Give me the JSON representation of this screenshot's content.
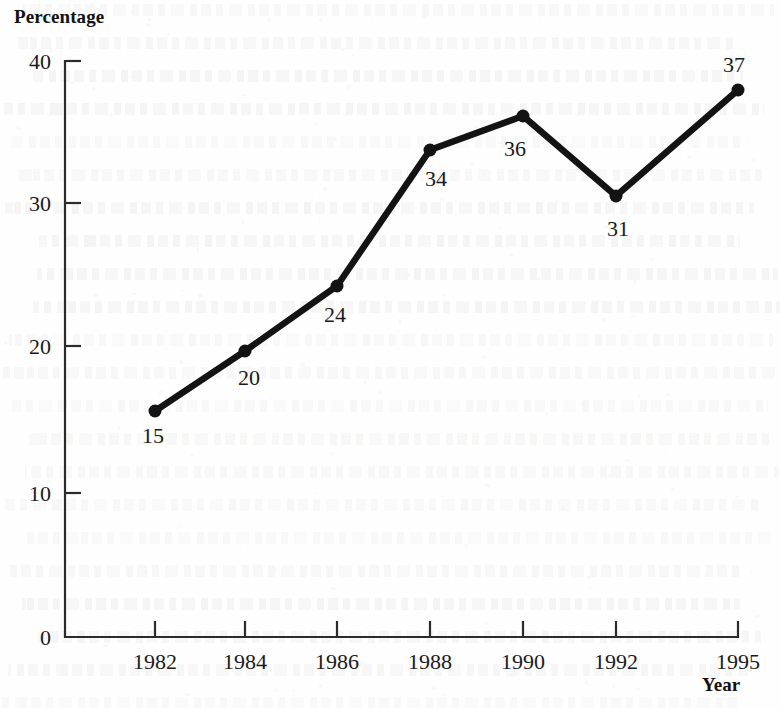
{
  "chart_data": {
    "type": "line",
    "title": "",
    "xlabel": "Year",
    "ylabel": "Percentage",
    "categories": [
      "1982",
      "1984",
      "1986",
      "1988",
      "1990",
      "1992",
      "1995"
    ],
    "values": [
      15,
      20,
      24,
      34,
      36,
      31,
      37
    ],
    "plotted_values": [
      15.5,
      19.9,
      24.4,
      33.8,
      36.2,
      30.6,
      38.0
    ],
    "point_labels": [
      "15",
      "20",
      "24",
      "34",
      "36",
      "31",
      "37"
    ],
    "series": [
      {
        "name": "Percentage",
        "values": [
          15,
          20,
          24,
          34,
          36,
          31,
          37
        ]
      }
    ],
    "ylim": [
      0,
      40
    ],
    "y_ticks": [
      "0",
      "10",
      "20",
      "30",
      "40"
    ],
    "y_tick_values": [
      0,
      10,
      20,
      30,
      40
    ],
    "x_ticks": [
      "1982",
      "1984",
      "1986",
      "1988",
      "1990",
      "1992",
      "1995"
    ],
    "grid": false,
    "legend": "none",
    "marker": "filled-circle",
    "line_color": "#131313",
    "axis_color": "#2b2b2b",
    "background_color": "#fefefe"
  },
  "axes": {
    "y_title": "Percentage",
    "x_title": "Year"
  },
  "geometry": {
    "plot_left": 65,
    "plot_bottom": 637,
    "plot_top": 61,
    "plot_right": 738,
    "x_positions": [
      155,
      245,
      337,
      430,
      523,
      616,
      738
    ],
    "y_tick_positions": [
      637,
      493,
      346,
      203,
      61
    ],
    "point_y_positions": [
      411,
      351,
      286,
      150,
      116,
      196,
      90
    ],
    "label_offsets": [
      {
        "dx": -2,
        "dy": 32
      },
      {
        "dx": 4,
        "dy": 34
      },
      {
        "dx": -2,
        "dy": 36
      },
      {
        "dx": 6,
        "dy": 36
      },
      {
        "dx": -8,
        "dy": 40
      },
      {
        "dx": 2,
        "dy": 40
      },
      {
        "dx": -4,
        "dy": -18
      }
    ]
  }
}
